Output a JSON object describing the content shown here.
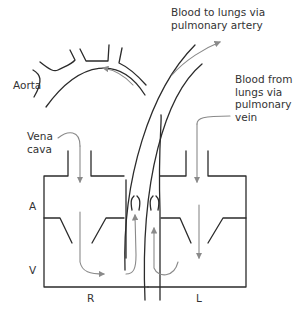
{
  "diagram": {
    "labels": {
      "aorta": "Aorta",
      "vena_cava": "Vena\ncava",
      "pulmonary_artery": "Blood to lungs via\npulmonary artery",
      "pulmonary_vein": "Blood from\nlungs via\npulmonary\nvein",
      "atrium": "A",
      "ventricle": "V",
      "right": "R",
      "left": "L"
    },
    "colors": {
      "wall": "#2b2b2b",
      "flow_arrow": "#8a8a8a",
      "text": "#333333"
    }
  }
}
